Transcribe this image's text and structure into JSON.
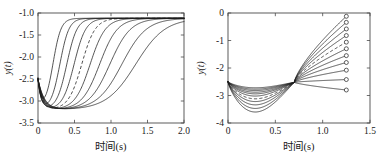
{
  "figure": {
    "panel_count": 2,
    "background_color": "#ffffff",
    "curve_color": "#1c1c1c",
    "axis_color": "#4a4a4a"
  },
  "chart_data": [
    {
      "type": "line",
      "panel": "left",
      "title": "",
      "xlabel": "时间(s)",
      "ylabel": "y(t)",
      "xlim": [
        0,
        2.0
      ],
      "ylim": [
        -3.5,
        -1.0
      ],
      "xticks": [
        0,
        0.5,
        1.0,
        1.5,
        2.0
      ],
      "xticklabels": [
        "0",
        "0.5",
        "1.0",
        "1.5",
        "2.0"
      ],
      "yticks": [
        -3.5,
        -3.0,
        -2.5,
        -2.0,
        -1.5,
        -1.0
      ],
      "yticklabels": [
        "-3.5",
        "-3.0",
        "-2.5",
        "-2.0",
        "-1.5",
        "-1.0"
      ],
      "grid": false,
      "legend": "none",
      "start_value": -2.5,
      "dip_value": -3.2,
      "final_value": -1.12,
      "series": [
        {
          "name": "s1",
          "style": "solid",
          "dip_end": 0.1,
          "rise_mid": 0.205,
          "rise_width": 0.055,
          "dip_depth": -3.19
        },
        {
          "name": "s2",
          "style": "solid",
          "dip_end": 0.18,
          "rise_mid": 0.3,
          "rise_width": 0.062,
          "dip_depth": -3.2
        },
        {
          "name": "s3",
          "style": "solid",
          "dip_end": 0.26,
          "rise_mid": 0.395,
          "rise_width": 0.07,
          "dip_depth": -3.2
        },
        {
          "name": "s4",
          "style": "solid",
          "dip_end": 0.35,
          "rise_mid": 0.495,
          "rise_width": 0.08,
          "dip_depth": -3.2
        },
        {
          "name": "s5",
          "style": "dashed",
          "dip_end": 0.45,
          "rise_mid": 0.6,
          "rise_width": 0.092,
          "dip_depth": -3.2
        },
        {
          "name": "s6",
          "style": "solid",
          "dip_end": 0.56,
          "rise_mid": 0.715,
          "rise_width": 0.105,
          "dip_depth": -3.2
        },
        {
          "name": "s7",
          "style": "solid",
          "dip_end": 0.68,
          "rise_mid": 0.845,
          "rise_width": 0.122,
          "dip_depth": -3.2
        },
        {
          "name": "s8",
          "style": "solid",
          "dip_end": 0.8,
          "rise_mid": 0.985,
          "rise_width": 0.142,
          "dip_depth": -3.2
        },
        {
          "name": "s9",
          "style": "solid",
          "dip_end": 0.92,
          "rise_mid": 1.15,
          "rise_width": 0.168,
          "dip_depth": -3.2
        },
        {
          "name": "s10",
          "style": "solid",
          "dip_end": 1.02,
          "rise_mid": 1.34,
          "rise_width": 0.2,
          "dip_depth": -3.2
        }
      ]
    },
    {
      "type": "line",
      "panel": "right",
      "title": "",
      "xlabel": "时间(s)",
      "ylabel": "y(t)",
      "xlim": [
        0,
        1.5
      ],
      "ylim": [
        -4,
        0
      ],
      "xticks": [
        0,
        0.5,
        1.0,
        1.5
      ],
      "xticklabels": [
        "0",
        "0.5",
        "1.0",
        "1.5"
      ],
      "yticks": [
        -4,
        -3,
        -2,
        -1,
        0
      ],
      "yticklabels": [
        "-4",
        "-3",
        "-2",
        "-1",
        "0"
      ],
      "grid": false,
      "legend": "none",
      "start_value": -2.5,
      "crossing_x": 0.7,
      "crossing_y": -2.52,
      "dip_x": 0.48,
      "marker_x": 1.25,
      "marker_style": "open-circle",
      "series": [
        {
          "name": "r1",
          "style": "solid",
          "dip_depth": -3.6,
          "end_value": -0.12
        },
        {
          "name": "r2",
          "style": "solid",
          "dip_depth": -3.47,
          "end_value": -0.34
        },
        {
          "name": "r3",
          "style": "solid",
          "dip_depth": -3.34,
          "end_value": -0.58
        },
        {
          "name": "r4",
          "style": "solid",
          "dip_depth": -3.22,
          "end_value": -0.82
        },
        {
          "name": "r5",
          "style": "dashed",
          "dip_depth": -3.12,
          "end_value": -1.06
        },
        {
          "name": "r6",
          "style": "solid",
          "dip_depth": -3.02,
          "end_value": -1.3
        },
        {
          "name": "r7",
          "style": "solid",
          "dip_depth": -2.94,
          "end_value": -1.55
        },
        {
          "name": "r8",
          "style": "solid",
          "dip_depth": -2.88,
          "end_value": -1.8
        },
        {
          "name": "r9",
          "style": "solid",
          "dip_depth": -2.82,
          "end_value": -2.08
        },
        {
          "name": "r10",
          "style": "solid",
          "dip_depth": -2.77,
          "end_value": -2.42
        },
        {
          "name": "r11",
          "style": "solid",
          "dip_depth": -2.72,
          "end_value": -2.8
        }
      ]
    }
  ]
}
